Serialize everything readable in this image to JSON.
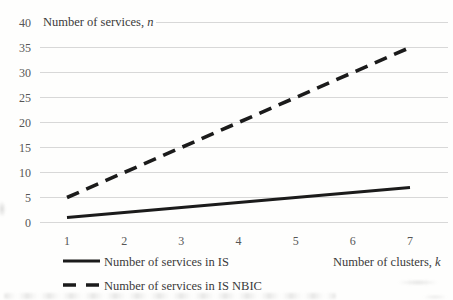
{
  "chart_data": {
    "type": "line",
    "title": "Number of services, n",
    "xlabel": "Number of clusters, k",
    "ylabel": "Number of services, n",
    "x": [
      1,
      2,
      3,
      4,
      5,
      6,
      7
    ],
    "xticks": [
      1,
      2,
      3,
      4,
      5,
      6,
      7
    ],
    "yticks": [
      0,
      5,
      10,
      15,
      20,
      25,
      30,
      35,
      40
    ],
    "xlim": [
      1,
      7
    ],
    "ylim": [
      0,
      40
    ],
    "grid": true,
    "legend_position": "bottom-left",
    "series": [
      {
        "name": "Number of services in IS",
        "line_style": "solid",
        "color": "#1b1b1b",
        "values": [
          1,
          2,
          3,
          4,
          5,
          6,
          7
        ]
      },
      {
        "name": "Number of services in IS NBIC",
        "line_style": "dashed",
        "color": "#1b1b1b",
        "values": [
          5,
          10,
          15,
          20,
          25,
          30,
          35
        ]
      }
    ],
    "colors": {
      "grid": "#d8d8d8",
      "line": "#1b1b1b",
      "tick_text": "#565656",
      "label_text": "#3a3a3a"
    }
  },
  "labels": {
    "y_axis_title_text": "Number of services, ",
    "y_axis_title_var": "n",
    "x_axis_title_text": "Number of clusters, ",
    "x_axis_title_var": "k",
    "legend_is": "Number of services in IS",
    "legend_nbic": "Number of services in IS NBIC"
  }
}
